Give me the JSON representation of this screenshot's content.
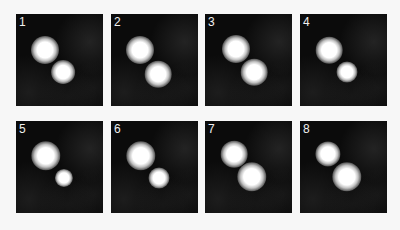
{
  "figure": {
    "panels": [
      {
        "label": "1",
        "x": 16,
        "y": 14,
        "spots": [
          {
            "cx": 29,
            "cy": 36,
            "d": 20
          },
          {
            "cx": 47,
            "cy": 58,
            "d": 17
          }
        ]
      },
      {
        "label": "2",
        "x": 111,
        "y": 14,
        "spots": [
          {
            "cx": 29,
            "cy": 36,
            "d": 20
          },
          {
            "cx": 47,
            "cy": 60,
            "d": 19
          }
        ]
      },
      {
        "label": "3",
        "x": 205,
        "y": 14,
        "spots": [
          {
            "cx": 31,
            "cy": 35,
            "d": 20
          },
          {
            "cx": 49,
            "cy": 58,
            "d": 19
          }
        ]
      },
      {
        "label": "4",
        "x": 300,
        "y": 14,
        "spots": [
          {
            "cx": 29,
            "cy": 36,
            "d": 19
          },
          {
            "cx": 47,
            "cy": 58,
            "d": 15
          }
        ]
      },
      {
        "label": "5",
        "x": 16,
        "y": 121,
        "spots": [
          {
            "cx": 30,
            "cy": 35,
            "d": 21
          },
          {
            "cx": 48,
            "cy": 57,
            "d": 13
          }
        ]
      },
      {
        "label": "6",
        "x": 111,
        "y": 121,
        "spots": [
          {
            "cx": 30,
            "cy": 35,
            "d": 21
          },
          {
            "cx": 48,
            "cy": 57,
            "d": 15
          }
        ]
      },
      {
        "label": "7",
        "x": 205,
        "y": 121,
        "spots": [
          {
            "cx": 29,
            "cy": 33,
            "d": 19
          },
          {
            "cx": 47,
            "cy": 56,
            "d": 21
          }
        ]
      },
      {
        "label": "8",
        "x": 300,
        "y": 121,
        "spots": [
          {
            "cx": 28,
            "cy": 33,
            "d": 18
          },
          {
            "cx": 47,
            "cy": 56,
            "d": 21
          }
        ]
      }
    ]
  }
}
